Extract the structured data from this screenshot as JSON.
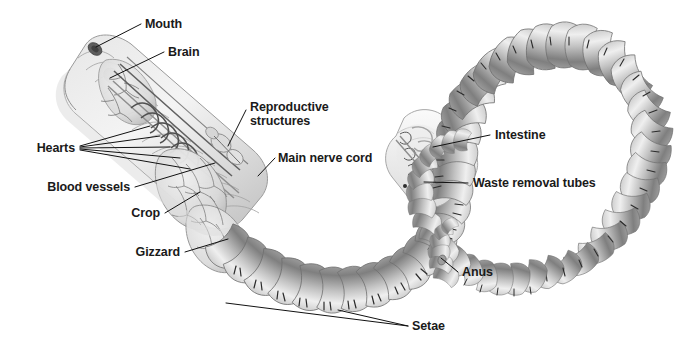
{
  "figure": {
    "background_color": "#ffffff",
    "label_color": "#1a1a1a",
    "leader_color": "#111111",
    "body_light": "#f2f2f2",
    "body_mid": "#c9c9c9",
    "body_dark": "#8d8d8d",
    "organ_tint": "#e3e3e3",
    "vessel_color": "#5a5a5a"
  },
  "labels": [
    {
      "id": "mouth",
      "text": "Mouth",
      "x": 145,
      "y": 18,
      "align": "left"
    },
    {
      "id": "brain",
      "text": "Brain",
      "x": 168,
      "y": 46,
      "align": "left"
    },
    {
      "id": "reproductive",
      "text": "Reproductive",
      "x": 250,
      "y": 101,
      "align": "left"
    },
    {
      "id": "reproductive2",
      "text": "structures",
      "x": 250,
      "y": 115,
      "align": "left"
    },
    {
      "id": "hearts",
      "text": "Hearts",
      "x": 75,
      "y": 142,
      "align": "right"
    },
    {
      "id": "nervecord",
      "text": "Main nerve cord",
      "x": 278,
      "y": 152,
      "align": "left"
    },
    {
      "id": "bloodvessels",
      "text": "Blood vessels",
      "x": 130,
      "y": 181,
      "align": "right"
    },
    {
      "id": "crop",
      "text": "Crop",
      "x": 160,
      "y": 207,
      "align": "right"
    },
    {
      "id": "gizzard",
      "text": "Gizzard",
      "x": 180,
      "y": 246,
      "align": "right"
    },
    {
      "id": "intestine",
      "text": "Intestine",
      "x": 495,
      "y": 129,
      "align": "left"
    },
    {
      "id": "waste",
      "text": "Waste removal tubes",
      "x": 473,
      "y": 177,
      "align": "left"
    },
    {
      "id": "anus",
      "text": "Anus",
      "x": 462,
      "y": 266,
      "align": "left"
    },
    {
      "id": "setae",
      "text": "Setae",
      "x": 412,
      "y": 320,
      "align": "left"
    }
  ],
  "structures": [
    {
      "id": "mouth",
      "name": "mouth-opening"
    },
    {
      "id": "brain",
      "name": "cerebral-ganglion"
    },
    {
      "id": "hearts",
      "name": "aortic-arches"
    },
    {
      "id": "crop",
      "name": "crop"
    },
    {
      "id": "gizzard",
      "name": "gizzard"
    },
    {
      "id": "intestine",
      "name": "intestine"
    },
    {
      "id": "nephridia",
      "name": "waste-removal-tubes"
    },
    {
      "id": "nervecord",
      "name": "ventral-nerve-cord"
    },
    {
      "id": "vessels",
      "name": "blood-vessels"
    },
    {
      "id": "reproductive",
      "name": "reproductive-structures"
    },
    {
      "id": "setae",
      "name": "setae-bristles"
    },
    {
      "id": "anus",
      "name": "anus"
    }
  ]
}
